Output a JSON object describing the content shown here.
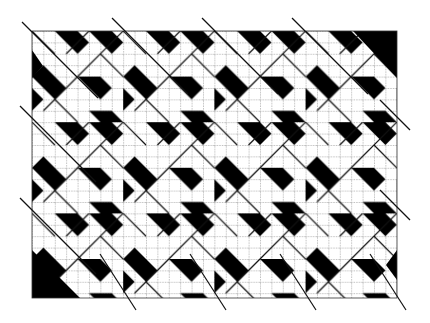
{
  "figure": {
    "colors": {
      "background": "#ffffff",
      "fill": "#000000",
      "grid": "#555555",
      "line": "#111111"
    },
    "grid": {
      "x": 32,
      "y": 31,
      "width": 365,
      "height": 267,
      "cell": 11.4,
      "columns": 32,
      "rows": 23
    },
    "repeat": {
      "tile_cells": 8
    }
  }
}
